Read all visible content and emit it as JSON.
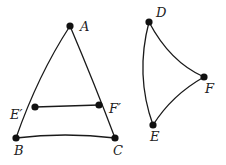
{
  "diagram": {
    "figure1": {
      "points": [
        {
          "id": "A",
          "label": "A",
          "x": 70,
          "y": 26,
          "lx": 80,
          "ly": 31
        },
        {
          "id": "Ep",
          "label": "E′",
          "x": 35,
          "y": 107,
          "lx": 10,
          "ly": 119
        },
        {
          "id": "Fp",
          "label": "F′",
          "x": 99,
          "y": 105,
          "lx": 109,
          "ly": 113
        },
        {
          "id": "B",
          "label": "B",
          "x": 16,
          "y": 138,
          "lx": 14,
          "ly": 155
        },
        {
          "id": "C",
          "label": "C",
          "x": 115,
          "y": 138,
          "lx": 113,
          "ly": 155
        }
      ]
    },
    "figure2": {
      "points": [
        {
          "id": "D",
          "label": "D",
          "x": 149,
          "y": 22,
          "lx": 156,
          "ly": 17
        },
        {
          "id": "F",
          "label": "F",
          "x": 204,
          "y": 77,
          "lx": 205,
          "ly": 93
        },
        {
          "id": "E",
          "label": "E",
          "x": 153,
          "y": 125,
          "lx": 150,
          "ly": 141
        }
      ]
    }
  }
}
